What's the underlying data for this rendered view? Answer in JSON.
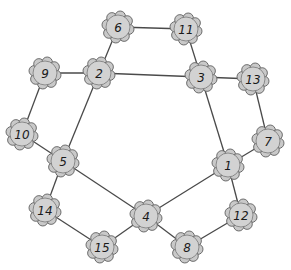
{
  "diagram": {
    "type": "undirected-graph",
    "node_style": {
      "shape": "flower",
      "fill": "#c9c9c9",
      "stroke": "#6b6b6b"
    },
    "edge_color": "#4a4a4a",
    "nodes": [
      {
        "id": "1",
        "label": "1",
        "x": 228,
        "y": 165
      },
      {
        "id": "2",
        "label": "2",
        "x": 99,
        "y": 73
      },
      {
        "id": "3",
        "label": "3",
        "x": 201,
        "y": 77
      },
      {
        "id": "4",
        "label": "4",
        "x": 146,
        "y": 216
      },
      {
        "id": "5",
        "label": "5",
        "x": 63,
        "y": 161
      },
      {
        "id": "6",
        "label": "6",
        "x": 118,
        "y": 27
      },
      {
        "id": "7",
        "label": "7",
        "x": 268,
        "y": 141
      },
      {
        "id": "8",
        "label": "8",
        "x": 187,
        "y": 247
      },
      {
        "id": "9",
        "label": "9",
        "x": 45,
        "y": 73
      },
      {
        "id": "10",
        "label": "10",
        "x": 22,
        "y": 134
      },
      {
        "id": "11",
        "label": "11",
        "x": 186,
        "y": 29
      },
      {
        "id": "12",
        "label": "12",
        "x": 241,
        "y": 215
      },
      {
        "id": "13",
        "label": "13",
        "x": 253,
        "y": 79
      },
      {
        "id": "14",
        "label": "14",
        "x": 45,
        "y": 210
      },
      {
        "id": "15",
        "label": "15",
        "x": 102,
        "y": 247
      }
    ],
    "edges": [
      [
        "6",
        "11"
      ],
      [
        "6",
        "2"
      ],
      [
        "11",
        "3"
      ],
      [
        "9",
        "2"
      ],
      [
        "2",
        "3"
      ],
      [
        "3",
        "13"
      ],
      [
        "9",
        "10"
      ],
      [
        "2",
        "5"
      ],
      [
        "10",
        "5"
      ],
      [
        "3",
        "1"
      ],
      [
        "13",
        "7"
      ],
      [
        "7",
        "1"
      ],
      [
        "5",
        "14"
      ],
      [
        "5",
        "4"
      ],
      [
        "1",
        "4"
      ],
      [
        "1",
        "12"
      ],
      [
        "14",
        "15"
      ],
      [
        "15",
        "4"
      ],
      [
        "4",
        "8"
      ],
      [
        "8",
        "12"
      ]
    ]
  }
}
